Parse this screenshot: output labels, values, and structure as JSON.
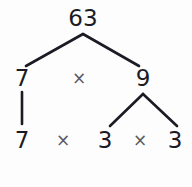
{
  "diagram": {
    "type": "factor-tree",
    "root_value": "63",
    "colors": {
      "background": "#fdfdfd",
      "node_text": "#1b1b24",
      "operator_text": "#5a5a63",
      "edge_stroke": "#1b1b24"
    },
    "levels": [
      {
        "level": 0,
        "nodes": [
          {
            "label": "63",
            "x": 83,
            "y": 18
          }
        ],
        "operators": []
      },
      {
        "level": 1,
        "nodes": [
          {
            "label": "7",
            "x": 22,
            "y": 78
          },
          {
            "label": "9",
            "x": 143,
            "y": 78
          }
        ],
        "operators": [
          {
            "label": "×",
            "x": 79,
            "y": 78
          }
        ]
      },
      {
        "level": 2,
        "nodes": [
          {
            "label": "7",
            "x": 22,
            "y": 140
          },
          {
            "label": "3",
            "x": 105,
            "y": 140
          },
          {
            "label": "3",
            "x": 175,
            "y": 140
          }
        ],
        "operators": [
          {
            "label": "×",
            "x": 63,
            "y": 140
          },
          {
            "label": "×",
            "x": 140,
            "y": 140
          }
        ]
      }
    ],
    "edges": [
      {
        "name": "edge-63-to-7",
        "x1": 83,
        "y1": 34,
        "x2": 26,
        "y2": 66
      },
      {
        "name": "edge-63-to-9",
        "x1": 83,
        "y1": 34,
        "x2": 139,
        "y2": 66
      },
      {
        "name": "edge-7-to-7",
        "x1": 22,
        "y1": 92,
        "x2": 22,
        "y2": 124
      },
      {
        "name": "edge-9-to-3-left",
        "x1": 143,
        "y1": 94,
        "x2": 110,
        "y2": 126
      },
      {
        "name": "edge-9-to-3-right",
        "x1": 143,
        "y1": 94,
        "x2": 177,
        "y2": 126
      }
    ],
    "factorization": "63 = 7 × 3 × 3"
  }
}
